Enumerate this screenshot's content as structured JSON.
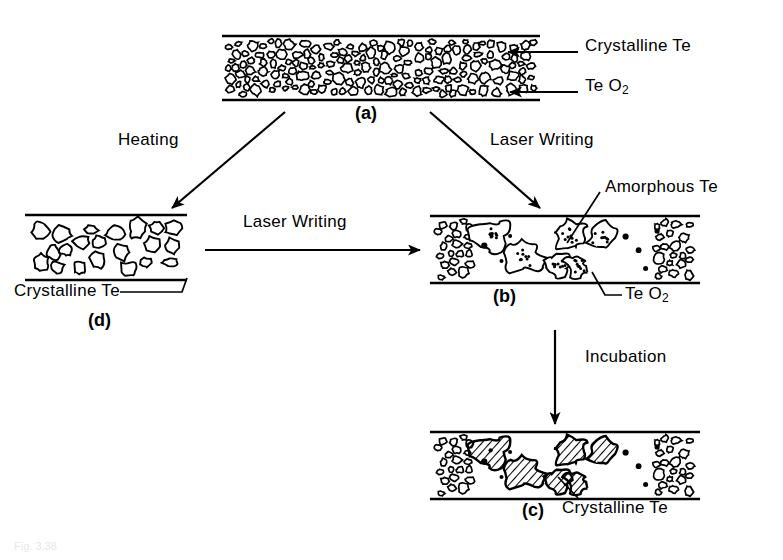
{
  "figure": {
    "caption_faint": "Fig. 3.38",
    "background_color": "#ffffff",
    "ink_color": "#000000"
  },
  "panels": [
    {
      "id": "a",
      "label": "(a)",
      "description": "As-deposited film: dense fine crystalline Te grains throughout TeO2 matrix",
      "fill_style": "fine-grains",
      "x": 222,
      "y": 36,
      "w": 318,
      "h": 64,
      "label_x": 355,
      "label_y": 106
    },
    {
      "id": "d",
      "label": "(d)",
      "description": "Heated film: coarsened crystalline Te grains",
      "fill_style": "coarse-grains",
      "x": 25,
      "y": 215,
      "w": 162,
      "h": 65,
      "label_x": 95,
      "label_y": 316
    },
    {
      "id": "b",
      "label": "(b)",
      "description": "Laser written film: amorphous Te blobs in written track, fine grains at edges",
      "fill_style": "stippled-blobs",
      "x": 430,
      "y": 216,
      "w": 270,
      "h": 67,
      "label_x": 495,
      "label_y": 290
    },
    {
      "id": "c",
      "label": "(c)",
      "description": "Incubated film: written blobs have crystallized, shown hatched",
      "fill_style": "hatched-blobs",
      "x": 430,
      "y": 432,
      "w": 270,
      "h": 67,
      "label_x": 528,
      "label_y": 506
    }
  ],
  "callouts": [
    {
      "name": "crystalline-te-a",
      "text": "Crystalline Te",
      "text_x": 585,
      "text_y": 45,
      "sub": ""
    },
    {
      "name": "teo2-a",
      "text": "Te O",
      "text_x": 585,
      "text_y": 85,
      "sub": "2"
    },
    {
      "name": "amorphous-te-b",
      "text": "Amorphous Te",
      "text_x": 605,
      "text_y": 186,
      "sub": ""
    },
    {
      "name": "teo2-b",
      "text": "Te O",
      "text_x": 625,
      "text_y": 293,
      "sub": "2"
    },
    {
      "name": "crystalline-te-d",
      "text": "Crystalline Te",
      "text_x": 18,
      "text_y": 288,
      "sub": ""
    },
    {
      "name": "crystalline-te-c",
      "text": "Crystalline Te",
      "text_x": 562,
      "text_y": 505,
      "sub": ""
    }
  ],
  "arrows": [
    {
      "name": "heating-arrow",
      "label": "Heating",
      "label_x": 118,
      "label_y": 138,
      "from": [
        285,
        112
      ],
      "to": [
        172,
        208
      ]
    },
    {
      "name": "laser-writing-arrow-a-to-b",
      "label": "Laser Writing",
      "label_x": 490,
      "label_y": 138,
      "from": [
        430,
        112
      ],
      "to": [
        540,
        208
      ]
    },
    {
      "name": "laser-writing-arrow-d-to-b",
      "label": "Laser Writing",
      "label_x": 243,
      "label_y": 220,
      "from": [
        205,
        250
      ],
      "to": [
        420,
        250
      ]
    },
    {
      "name": "incubation-arrow",
      "label": "Incubation",
      "label_x": 585,
      "label_y": 355,
      "from": [
        555,
        330
      ],
      "to": [
        555,
        424
      ]
    }
  ],
  "legend_terms": [
    "Crystalline Te",
    "TeO2",
    "Amorphous Te",
    "Heating",
    "Laser Writing",
    "Incubation"
  ]
}
